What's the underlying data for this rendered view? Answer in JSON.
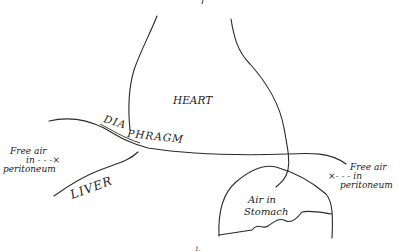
{
  "diagram": {
    "type": "anatomical-line-drawing",
    "labels": {
      "heart": "HEART",
      "diaphragm": "DIAPHRAGM",
      "liver": "LIVER",
      "stomach_line1": "Air in",
      "stomach_line2": "Stomach",
      "left_air_line1": "Free air",
      "left_air_line2": "in - - -×",
      "left_air_line3": "peritoneum",
      "right_air_line1": "Free air",
      "right_air_line2": "×- - -  in",
      "right_air_line3": "peritoneum",
      "top_mark": "",
      "bottom_mark": "1."
    },
    "colors": {
      "stroke": "#2a2a2a",
      "background": "#ffffff"
    }
  }
}
